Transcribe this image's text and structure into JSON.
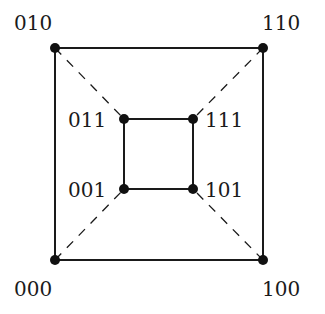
{
  "diagram": {
    "type": "graph",
    "title": "",
    "colors": {
      "line": "#1a1a1a",
      "vertex": "#111111",
      "background": "#ffffff"
    },
    "vertices": [
      {
        "id": "010",
        "label": "010",
        "x": 55,
        "y": 48,
        "label_x": 14,
        "label_y": 30
      },
      {
        "id": "110",
        "label": "110",
        "x": 263,
        "y": 48,
        "label_x": 262,
        "label_y": 30
      },
      {
        "id": "011",
        "label": "011",
        "x": 124,
        "y": 119,
        "label_x": 68,
        "label_y": 127
      },
      {
        "id": "111",
        "label": "111",
        "x": 193,
        "y": 119,
        "label_x": 205,
        "label_y": 127
      },
      {
        "id": "001",
        "label": "001",
        "x": 124,
        "y": 189,
        "label_x": 68,
        "label_y": 197
      },
      {
        "id": "101",
        "label": "101",
        "x": 193,
        "y": 189,
        "label_x": 205,
        "label_y": 197
      },
      {
        "id": "000",
        "label": "000",
        "x": 55,
        "y": 260,
        "label_x": 14,
        "label_y": 296
      },
      {
        "id": "100",
        "label": "100",
        "x": 263,
        "y": 260,
        "label_x": 262,
        "label_y": 296
      }
    ],
    "edges": [
      {
        "from": "010",
        "to": "110",
        "style": "solid"
      },
      {
        "from": "110",
        "to": "100",
        "style": "solid"
      },
      {
        "from": "100",
        "to": "000",
        "style": "solid"
      },
      {
        "from": "000",
        "to": "010",
        "style": "solid"
      },
      {
        "from": "011",
        "to": "111",
        "style": "solid"
      },
      {
        "from": "111",
        "to": "101",
        "style": "solid"
      },
      {
        "from": "101",
        "to": "001",
        "style": "solid"
      },
      {
        "from": "001",
        "to": "011",
        "style": "solid"
      },
      {
        "from": "010",
        "to": "011",
        "style": "dashed"
      },
      {
        "from": "110",
        "to": "111",
        "style": "dashed"
      },
      {
        "from": "000",
        "to": "001",
        "style": "dashed"
      },
      {
        "from": "100",
        "to": "101",
        "style": "dashed"
      }
    ]
  }
}
